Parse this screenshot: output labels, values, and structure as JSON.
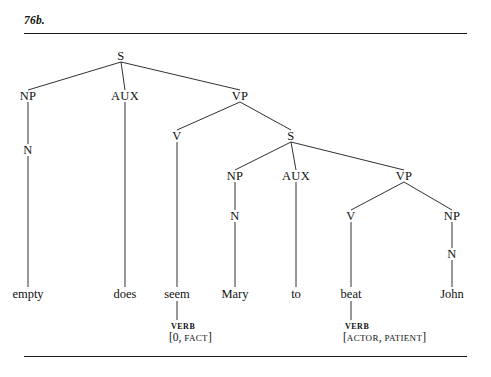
{
  "figure": {
    "label": "76b.",
    "rules": [
      "top-rule",
      "bottom-rule"
    ]
  },
  "tree": {
    "nodes": [
      {
        "id": "s-root",
        "label": "S",
        "x": 121,
        "y": 58
      },
      {
        "id": "np-1",
        "label": "NP",
        "x": 28,
        "y": 98
      },
      {
        "id": "aux-1",
        "label": "AUX",
        "x": 125,
        "y": 98
      },
      {
        "id": "vp-1",
        "label": "VP",
        "x": 240,
        "y": 98
      },
      {
        "id": "n-1",
        "label": "N",
        "x": 28,
        "y": 152
      },
      {
        "id": "v-1",
        "label": "V",
        "x": 177,
        "y": 138
      },
      {
        "id": "s-2",
        "label": "S",
        "x": 291,
        "y": 138
      },
      {
        "id": "np-2",
        "label": "NP",
        "x": 235,
        "y": 178
      },
      {
        "id": "aux-2",
        "label": "AUX",
        "x": 296,
        "y": 178
      },
      {
        "id": "vp-2",
        "label": "VP",
        "x": 404,
        "y": 178
      },
      {
        "id": "n-2",
        "label": "N",
        "x": 235,
        "y": 218
      },
      {
        "id": "v-2",
        "label": "V",
        "x": 351,
        "y": 218
      },
      {
        "id": "np-3",
        "label": "NP",
        "x": 452,
        "y": 218
      },
      {
        "id": "n-3",
        "label": "N",
        "x": 452,
        "y": 256
      }
    ],
    "leaves": [
      {
        "id": "leaf-empty",
        "label": "empty",
        "x": 28,
        "y": 295
      },
      {
        "id": "leaf-does",
        "label": "does",
        "x": 125,
        "y": 295
      },
      {
        "id": "leaf-seem",
        "label": "seem",
        "x": 177,
        "y": 295
      },
      {
        "id": "leaf-mary",
        "label": "Mary",
        "x": 235,
        "y": 295
      },
      {
        "id": "leaf-to",
        "label": "to",
        "x": 296,
        "y": 295
      },
      {
        "id": "leaf-beat",
        "label": "beat",
        "x": 351,
        "y": 295
      },
      {
        "id": "leaf-john",
        "label": "John",
        "x": 452,
        "y": 295
      }
    ],
    "features": [
      {
        "id": "feat-seem",
        "category": "VERB",
        "bracket_open": "[",
        "roles": [
          "0",
          "FACT"
        ],
        "separator": ", ",
        "bracket_close": "]",
        "x": 171,
        "y_category": 326,
        "y_roles": 337
      },
      {
        "id": "feat-beat",
        "category": "VERB",
        "bracket_open": "[",
        "roles": [
          "ACTOR",
          "PATIENT"
        ],
        "separator": ", ",
        "bracket_close": "]",
        "x": 345,
        "y_category": 326,
        "y_roles": 337
      }
    ]
  }
}
